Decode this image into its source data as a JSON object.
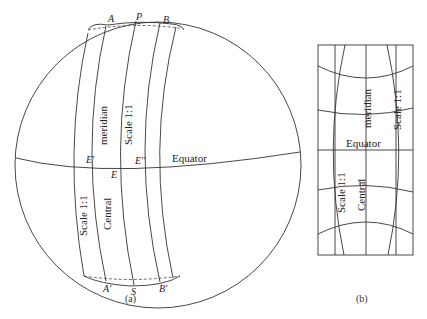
{
  "figure": {
    "panel_a": {
      "caption": "(a)",
      "points": {
        "A": "A",
        "P": "P",
        "B": "B",
        "A_prime": "A'",
        "S": "S",
        "B_prime": "B'",
        "E": "E",
        "E_prime": "E'",
        "E_double_prime": "E''"
      },
      "labels": {
        "equator": "Equator",
        "meridian": "meridian",
        "central": "Central",
        "scale_upper": "Scale 1:1",
        "scale_lower": "Scale 1:1"
      }
    },
    "panel_b": {
      "caption": "(b)",
      "labels": {
        "equator": "Equator",
        "meridian": "meridian",
        "central": "Central",
        "scale_upper": "Scale 1:1",
        "scale_lower": "Scale 1:1"
      }
    }
  }
}
